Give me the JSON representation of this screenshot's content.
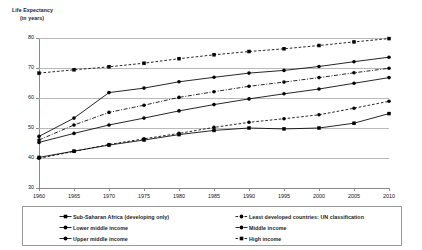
{
  "chart_data": {
    "type": "line",
    "title": "Life Expectancy (in years)",
    "title_line1": "Life Expectancy",
    "title_line2": "(in years)",
    "xlabel": "",
    "ylabel": "Life Expectancy (in years)",
    "x": [
      1960,
      1965,
      1970,
      1975,
      1980,
      1985,
      1990,
      1995,
      2000,
      2005,
      2010
    ],
    "xticklabels": [
      "1960",
      "1965",
      "1970",
      "1975",
      "1980",
      "1985",
      "1990",
      "1995",
      "2000",
      "2005",
      "2010"
    ],
    "yticklabels": [
      "30",
      "40",
      "50",
      "60",
      "70",
      "80"
    ],
    "yticks": [
      30,
      40,
      50,
      60,
      70,
      80
    ],
    "xlim": [
      1960,
      2010
    ],
    "ylim": [
      30,
      80
    ],
    "grid": "horizontal",
    "legend_position": "below",
    "legend_columns": 2,
    "series": [
      {
        "name": "Sub-Saharan Africa (developing only)",
        "marker": "square",
        "line": "solid",
        "color": "#000000",
        "values": [
          40.2,
          42.3,
          44.3,
          46.0,
          47.8,
          49.2,
          50.0,
          49.7,
          50.0,
          51.6,
          54.8
        ]
      },
      {
        "name": "Least developed countries: UN classification",
        "marker": "dot",
        "line": "dotted",
        "color": "#000000",
        "values": [
          39.9,
          42.2,
          44.5,
          46.4,
          48.2,
          50.2,
          51.9,
          53.1,
          54.4,
          56.6,
          58.9
        ]
      },
      {
        "name": "Lower middle income",
        "marker": "dot",
        "line": "solid",
        "color": "#000000",
        "values": [
          45.2,
          48.2,
          51.0,
          53.3,
          55.7,
          57.8,
          59.7,
          61.4,
          63.0,
          64.9,
          66.8
        ]
      },
      {
        "name": "Middle income",
        "marker": "dot",
        "line": "dash-dot",
        "color": "#000000",
        "values": [
          46.0,
          51.0,
          55.2,
          57.6,
          60.2,
          62.1,
          63.9,
          65.3,
          66.8,
          68.4,
          69.9
        ]
      },
      {
        "name": "Upper middle income",
        "marker": "dot",
        "line": "solid",
        "color": "#000000",
        "values": [
          47.2,
          53.3,
          61.8,
          63.3,
          65.4,
          66.9,
          68.3,
          69.2,
          70.5,
          72.1,
          73.6
        ]
      },
      {
        "name": "High income",
        "marker": "square",
        "line": "dotted",
        "color": "#000000",
        "values": [
          68.3,
          69.4,
          70.4,
          71.6,
          73.1,
          74.4,
          75.5,
          76.4,
          77.5,
          78.7,
          79.8
        ]
      }
    ]
  },
  "legend": {
    "left_column": [
      "Sub-Saharan Africa (developing only)",
      "Lower middle income",
      "Upper middle income"
    ],
    "right_column": [
      "Least developed countries: UN classification",
      "Middle income",
      "High income"
    ]
  }
}
